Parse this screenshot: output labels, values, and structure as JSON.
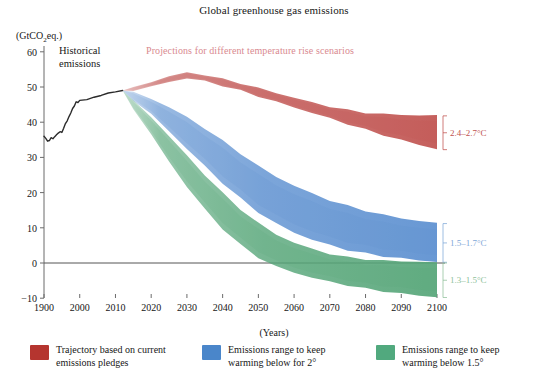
{
  "chart_data": {
    "type": "area",
    "title": "Global greenhouse gas emissions",
    "subtitle": "Projections for different temperature rise scenarios",
    "ylabel": "(GtCO2eq.)",
    "ylabel_parts": {
      "pre": "(GtCO",
      "sub": "2",
      "post": "eq.)"
    },
    "xlabel": "(Years)",
    "historical_label_line1": "Historical",
    "historical_label_line2": "emissions",
    "ylim": [
      -10,
      60
    ],
    "yticks": [
      60,
      50,
      40,
      30,
      20,
      10,
      0,
      -10
    ],
    "ytick_labels": [
      "60",
      "50",
      "40",
      "30",
      "20",
      "10",
      "0",
      "−10"
    ],
    "xticks": [
      1900,
      2000,
      2010,
      2020,
      2030,
      2040,
      2050,
      2060,
      2070,
      2080,
      2090,
      2100
    ],
    "xtick_labels": [
      "1900",
      "2000",
      "2010",
      "2020",
      "2030",
      "2040",
      "2050",
      "2060",
      "2070",
      "2080",
      "2090",
      "2100"
    ],
    "xaxis_note": "non-linear: 1900 to 2000 compressed to one decade-width step",
    "grid": false,
    "zero_line": true,
    "colors": {
      "red": "#c0524f",
      "blue": "#5b8fd0",
      "green": "#55a578",
      "subtitle": "#d98a90",
      "axis": "#6b6b6b",
      "historical_line": "#2b2b2b"
    },
    "series": [
      {
        "name": "Historical emissions",
        "type": "line",
        "color": "#2b2b2b",
        "x": [
          1900,
          1905,
          1910,
          1915,
          1920,
          1925,
          1930,
          1935,
          1940,
          1945,
          1950,
          1955,
          1960,
          1965,
          1970,
          1975,
          1980,
          1985,
          1990,
          1995,
          2000,
          2002,
          2004,
          2006,
          2008,
          2010,
          2012
        ],
        "y": [
          36.0,
          35.4,
          34.6,
          34.8,
          35.6,
          35.3,
          35.9,
          36.4,
          36.9,
          37.3,
          37.1,
          38.3,
          39.6,
          40.4,
          41.6,
          42.6,
          43.9,
          44.6,
          45.8,
          45.6,
          46.2,
          46.4,
          47.1,
          47.6,
          48.3,
          48.6,
          49.0
        ]
      },
      {
        "name": "Trajectory based on current emissions pledges",
        "type": "band",
        "color": "#c0524f",
        "x": [
          2012,
          2015,
          2020,
          2025,
          2030,
          2035,
          2040,
          2045,
          2050,
          2055,
          2060,
          2065,
          2070,
          2075,
          2080,
          2085,
          2090,
          2095,
          2100
        ],
        "upper": [
          49.0,
          50.0,
          51.6,
          53.2,
          54.2,
          53.6,
          52.4,
          51.2,
          49.8,
          48.4,
          47.0,
          45.6,
          44.4,
          43.4,
          42.6,
          42.2,
          42.0,
          41.8,
          41.8
        ],
        "lower": [
          49.0,
          49.2,
          50.2,
          51.6,
          52.6,
          51.8,
          50.4,
          49.0,
          47.4,
          45.8,
          44.2,
          42.6,
          41.0,
          39.4,
          37.8,
          36.2,
          34.8,
          33.4,
          32.2
        ],
        "end_label": "2.4–2.7°C"
      },
      {
        "name": "Emissions range to keep warming below for 2°",
        "type": "band",
        "color": "#5b8fd0",
        "x": [
          2012,
          2015,
          2020,
          2025,
          2030,
          2035,
          2040,
          2045,
          2050,
          2055,
          2060,
          2065,
          2070,
          2075,
          2080,
          2085,
          2090,
          2095,
          2100
        ],
        "upper": [
          49.0,
          48.6,
          46.8,
          44.4,
          41.6,
          38.4,
          34.8,
          31.2,
          27.6,
          24.6,
          22.0,
          19.8,
          17.8,
          16.2,
          14.8,
          13.6,
          12.6,
          11.8,
          11.2
        ],
        "lower": [
          49.0,
          46.4,
          42.4,
          37.6,
          32.6,
          27.6,
          22.8,
          18.4,
          14.4,
          11.2,
          8.6,
          6.6,
          5.0,
          3.6,
          2.6,
          1.8,
          1.2,
          0.6,
          0.2
        ],
        "end_label": "1.5–1.7°C"
      },
      {
        "name": "Emissions range to keep warming below 1.5°",
        "type": "band",
        "color": "#55a578",
        "x": [
          2012,
          2015,
          2020,
          2025,
          2030,
          2035,
          2040,
          2045,
          2050,
          2055,
          2060,
          2065,
          2070,
          2075,
          2080,
          2085,
          2090,
          2095,
          2100
        ],
        "upper": [
          49.0,
          46.2,
          41.6,
          36.2,
          30.6,
          25.2,
          20.0,
          15.4,
          11.4,
          8.2,
          5.8,
          4.0,
          2.6,
          1.6,
          1.0,
          0.6,
          0.4,
          0.2,
          0.0
        ],
        "lower": [
          49.0,
          44.0,
          36.6,
          29.0,
          21.8,
          15.4,
          9.8,
          5.2,
          1.6,
          -1.0,
          -2.8,
          -4.2,
          -5.4,
          -6.4,
          -7.4,
          -8.2,
          -8.8,
          -9.4,
          -9.8
        ],
        "end_label": "1.3–1.5°C"
      }
    ],
    "annotations": [
      {
        "text": "2.4–2.7°C",
        "color": "#c0524f",
        "at_year": 2100,
        "y_center": 37.0
      },
      {
        "text": "1.5–1.7°C",
        "color": "#7fa8d8",
        "at_year": 2100,
        "y_center": 5.7
      },
      {
        "text": "1.3–1.5°C",
        "color": "#8dbf9a",
        "at_year": 2100,
        "y_center": -4.9
      }
    ],
    "legend": {
      "position": "bottom",
      "entries": [
        {
          "color": "#b5352f",
          "line1": "Trajectory based on current",
          "line2": "emissions pledges"
        },
        {
          "color": "#4a86ca",
          "line1": "Emissions range to keep",
          "line2": "warming below for 2°"
        },
        {
          "color": "#51a97e",
          "line1": "Emissions range to keep",
          "line2": "warming below 1.5°"
        }
      ]
    }
  }
}
